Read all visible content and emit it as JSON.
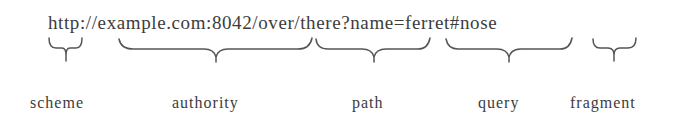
{
  "url": {
    "scheme": "http",
    "sep1": "://",
    "authority": "example.com:8042",
    "path": "/over/there",
    "sep2": "?",
    "query": "name=ferret",
    "sep3": "#",
    "fragment": "nose"
  },
  "labels": {
    "scheme": "scheme",
    "authority": "authority",
    "path": "path",
    "query": "query",
    "fragment": "fragment"
  },
  "colors": {
    "text": "#3c3c3c",
    "brace": "#555555",
    "background": "#ffffff"
  }
}
